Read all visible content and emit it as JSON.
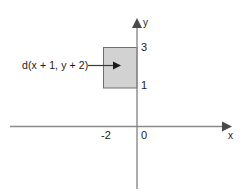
{
  "figure": {
    "type": "coordinate-plane-diagram",
    "background_color": "#ffffff",
    "axes": {
      "x_axis_label": "x",
      "y_axis_label": "y",
      "origin_label": "0",
      "axis_color": "#808080",
      "x_tick_labels": [
        "-2",
        "0"
      ],
      "y_tick_labels": [
        "3",
        "1"
      ]
    },
    "shape": {
      "kind": "rectangle",
      "label": "d(x + 1, y + 2)",
      "fill_color": "#d2d2d2",
      "stroke_color": "#6e6e6e",
      "x_range": [
        -2,
        0
      ],
      "y_range": [
        1,
        3
      ]
    },
    "annotation": {
      "leader_arrow": "arrow-right",
      "points_to": "rectangle"
    }
  }
}
